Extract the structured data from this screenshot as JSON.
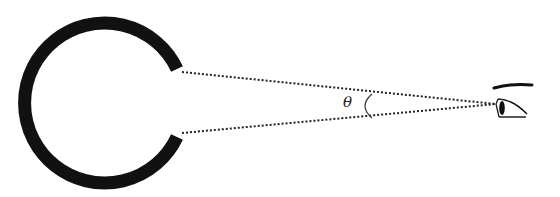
{
  "diagram": {
    "labels": {
      "angle": "θ"
    },
    "colors": {
      "stroke": "#111111",
      "background": "#ffffff"
    },
    "elements": {
      "object": "thick open ring (C-shape) with gap facing the eye",
      "sight_lines": "two dotted lines from gap edges converging at the eye",
      "angle_arc": "small arc marking angle θ near the eye",
      "eye": "side-view eye with eyebrow"
    }
  }
}
